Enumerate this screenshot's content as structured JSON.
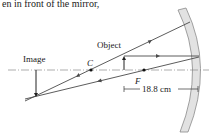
{
  "header_text": "en in front of the mirror,",
  "labels": {
    "object": "Object",
    "image": "Image",
    "center": "C",
    "focal": "F",
    "dimension": "18.8 cm"
  },
  "colors": {
    "ray": "#4a4a4a",
    "mirror_fill": "#e2e2e2",
    "mirror_stroke": "#8a8a8a",
    "axis": "#8a8a8a",
    "text": "#1a1a1a"
  },
  "diagram": {
    "type": "concave-mirror-ray-diagram",
    "focal_length_label": "18.8 cm"
  }
}
